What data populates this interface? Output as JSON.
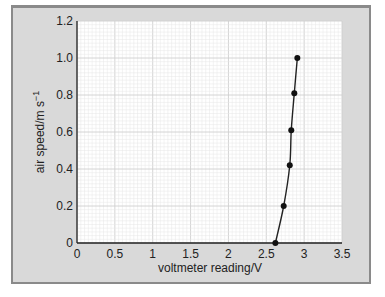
{
  "chart_data": {
    "type": "line",
    "title": "",
    "xlabel": "voltmeter reading/V",
    "ylabel": "air speed/m s",
    "ylabel_sup": "−1",
    "xlim": [
      0,
      3.5
    ],
    "ylim": [
      0,
      1.2
    ],
    "x_ticks": [
      "0",
      "0.5",
      "1",
      "1.5",
      "2",
      "2.5",
      "3",
      "3.5"
    ],
    "y_ticks": [
      "0",
      "0.2",
      "0.4",
      "0.6",
      "0.8",
      "1.0",
      "1.2"
    ],
    "grid": true,
    "legend": null,
    "series": [
      {
        "name": "air speed vs voltmeter reading",
        "x": [
          2.62,
          2.73,
          2.81,
          2.83,
          2.87,
          2.91
        ],
        "y": [
          0.0,
          0.2,
          0.42,
          0.61,
          0.81,
          1.0
        ],
        "markers": true,
        "smooth_curve": true
      }
    ]
  },
  "colors": {
    "frame_bg": "#d9d9d9",
    "frame_border": "#8a8a8a",
    "plot_bg": "#ffffff",
    "grid_minor": "#e6e6e6",
    "grid_major": "#cfcfcf",
    "line": "#222222"
  }
}
